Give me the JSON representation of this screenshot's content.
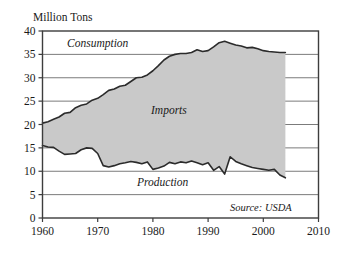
{
  "chart_data": {
    "type": "area",
    "title": "",
    "ylabel": "Million Tons",
    "xlabel": "",
    "xlim": [
      1960,
      2010
    ],
    "ylim": [
      0,
      40
    ],
    "xticks": [
      1960,
      1970,
      1980,
      1990,
      2000,
      2010
    ],
    "yticks": [
      0,
      5,
      10,
      15,
      20,
      25,
      30,
      35,
      40
    ],
    "grid": true,
    "legend_position": "inline-annotations",
    "annotations": [
      {
        "text": "Consumption",
        "x": 1978,
        "y": 37.2
      },
      {
        "text": "Imports",
        "x": 1990,
        "y": 22.8
      },
      {
        "text": "Production",
        "x": 1992,
        "y": 6.6
      }
    ],
    "source_note": "Source: USDA",
    "fill_color": "#c9c9c9",
    "line_color": "#2b2b2b",
    "x": [
      1960,
      1961,
      1962,
      1963,
      1964,
      1965,
      1966,
      1967,
      1968,
      1969,
      1970,
      1971,
      1972,
      1973,
      1974,
      1975,
      1976,
      1977,
      1978,
      1979,
      1980,
      1981,
      1982,
      1983,
      1984,
      1985,
      1986,
      1987,
      1988,
      1989,
      1990,
      1991,
      1992,
      1993,
      1994,
      1995,
      1996,
      1997,
      1998,
      1999,
      2000,
      2001,
      2002,
      2003,
      2004
    ],
    "series": [
      {
        "name": "Consumption",
        "values": [
          20.3,
          20.6,
          21.1,
          21.6,
          22.4,
          22.6,
          23.6,
          24.1,
          24.4,
          25.2,
          25.6,
          26.4,
          27.3,
          27.6,
          28.2,
          28.4,
          29.2,
          30.0,
          30.1,
          30.6,
          31.5,
          32.6,
          33.8,
          34.6,
          35.0,
          35.2,
          35.2,
          35.4,
          36.0,
          35.6,
          35.8,
          36.6,
          37.5,
          37.8,
          37.4,
          37.0,
          36.8,
          36.4,
          36.5,
          36.2,
          35.8,
          35.6,
          35.5,
          35.4,
          35.4
        ]
      },
      {
        "name": "Production",
        "values": [
          15.5,
          15.2,
          15.1,
          14.3,
          13.6,
          13.7,
          13.8,
          14.6,
          15.0,
          14.9,
          13.8,
          11.2,
          10.9,
          11.2,
          11.6,
          11.8,
          12.1,
          11.9,
          11.6,
          12.0,
          10.4,
          10.7,
          11.1,
          11.9,
          11.6,
          12.0,
          11.8,
          12.2,
          11.8,
          11.4,
          11.8,
          10.2,
          11.0,
          9.4,
          13.1,
          12.1,
          11.6,
          11.2,
          10.8,
          10.6,
          10.4,
          10.2,
          10.4,
          9.2,
          8.6
        ]
      }
    ]
  }
}
